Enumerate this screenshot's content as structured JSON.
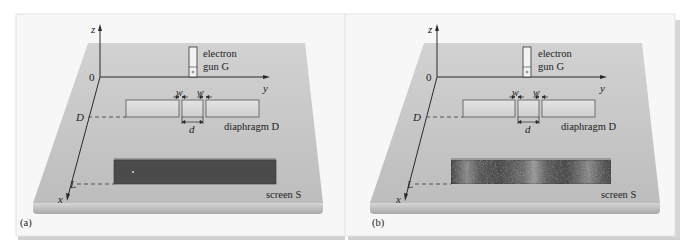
{
  "figure": {
    "panels": [
      {
        "id": "a",
        "caption": "(a)",
        "screen_pattern": "single-dot",
        "labels": {
          "z_axis": "z",
          "y_axis": "y",
          "x_axis": "x",
          "origin": "0",
          "D_position": "D",
          "L_position": "L",
          "gun_line1": "electron",
          "gun_line2": "gun G",
          "w_left": "w",
          "w_right": "w",
          "d": "d",
          "diaphragm": "diaphragm D",
          "screen": "screen S"
        }
      },
      {
        "id": "b",
        "caption": "(b)",
        "screen_pattern": "interference-fringes",
        "labels": {
          "z_axis": "z",
          "y_axis": "y",
          "x_axis": "x",
          "origin": "0",
          "D_position": "D",
          "L_position": "L",
          "gun_line1": "electron",
          "gun_line2": "gun G",
          "w_left": "w",
          "w_right": "w",
          "d": "d",
          "diaphragm": "diaphragm D",
          "screen": "screen S"
        }
      }
    ],
    "colors": {
      "frame_bg": "#f7f7f7",
      "slab_top": "#c9c9c9",
      "slab_edge": "#b4b4b4",
      "screen_dark": "#4a4a4a",
      "diaphragm": "#d9d9d9",
      "line": "#2a2a2a"
    }
  }
}
